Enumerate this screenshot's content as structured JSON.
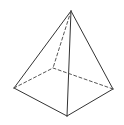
{
  "diagram": {
    "stroke_color": "#333333",
    "background": "#ffffff",
    "vertices": {
      "apex": [
        71,
        11
      ],
      "left": [
        14,
        88
      ],
      "front": [
        67,
        116
      ],
      "right": [
        113,
        89
      ],
      "back": [
        53,
        68
      ]
    },
    "visible_edges": [
      [
        "apex",
        "left"
      ],
      [
        "apex",
        "front"
      ],
      [
        "apex",
        "right"
      ],
      [
        "left",
        "front"
      ],
      [
        "front",
        "right"
      ]
    ],
    "hidden_edges": [
      [
        "apex",
        "back"
      ],
      [
        "left",
        "back"
      ],
      [
        "back",
        "right"
      ]
    ]
  }
}
